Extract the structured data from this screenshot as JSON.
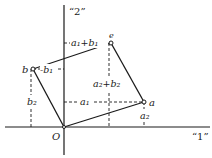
{
  "diagram": {
    "type": "vector-addition-parallelogram",
    "axes": {
      "horizontal_label": "“1”",
      "vertical_label": "“2”"
    },
    "origin_label": "O",
    "points": {
      "a": {
        "label": "a",
        "x": 144,
        "y": 102
      },
      "b": {
        "label": "b",
        "x": 33,
        "y": 69
      },
      "sum": {
        "label": "e",
        "x": 111,
        "y": 43
      }
    },
    "component_labels": {
      "a1": "a₁",
      "a2": "a₂",
      "b1": "-b₁",
      "b2": "b₂",
      "sum1": "a₁+b₁",
      "sum2": "a₂+b₂"
    },
    "colors": {
      "ink": "#1a1a1a",
      "background": "#ffffff"
    }
  }
}
